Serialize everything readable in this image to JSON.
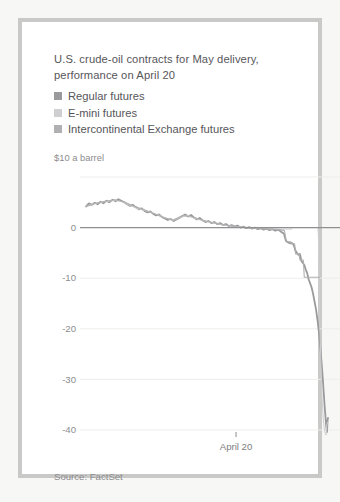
{
  "title": {
    "line1": "U.S. crude-oil contracts for May delivery,",
    "line2": "performance on April 20",
    "full": "U.S. crude-oil contracts for May delivery, performance on April 20"
  },
  "source": "Source: FactSet",
  "colors": {
    "series_regular": "#9a9a9c",
    "series_emini": "#cfcfd1",
    "series_ice": "#b0b0b2",
    "zero_line": "#8f8f91",
    "gridline": "#ededec",
    "text": "#56565a",
    "muted_text": "#8c8c8e",
    "frame": "#c9c9c7",
    "background": "#ffffff"
  },
  "chart_data": {
    "type": "line",
    "title": "U.S. crude-oil contracts for May delivery, performance on April 20",
    "subtitle": "",
    "xlabel": "",
    "ylabel": "$10 a barrel",
    "ylim": [
      -42,
      10
    ],
    "yticks": [
      10,
      0,
      -10,
      -20,
      -30,
      -40
    ],
    "ytick_labels": [
      "$10 a barrel",
      "0",
      "-10",
      "-20",
      "-30",
      "-40"
    ],
    "xticks": [
      0.62
    ],
    "xtick_labels": [
      "April 20"
    ],
    "xlim": [
      0,
      1
    ],
    "grid": true,
    "legend_position": "top-left",
    "annotations": [],
    "series": [
      {
        "name": "Regular futures",
        "color": "#9a9a9c",
        "width": 1.8,
        "points": [
          [
            0.0,
            4.2
          ],
          [
            0.012,
            4.8
          ],
          [
            0.024,
            4.5
          ],
          [
            0.036,
            4.9
          ],
          [
            0.048,
            4.6
          ],
          [
            0.06,
            5.1
          ],
          [
            0.072,
            4.8
          ],
          [
            0.084,
            5.3
          ],
          [
            0.096,
            5.0
          ],
          [
            0.11,
            5.5
          ],
          [
            0.122,
            5.2
          ],
          [
            0.134,
            5.6
          ],
          [
            0.146,
            5.3
          ],
          [
            0.158,
            5.0
          ],
          [
            0.17,
            4.6
          ],
          [
            0.182,
            4.3
          ],
          [
            0.194,
            4.5
          ],
          [
            0.206,
            4.0
          ],
          [
            0.218,
            3.6
          ],
          [
            0.23,
            3.8
          ],
          [
            0.242,
            3.3
          ],
          [
            0.254,
            3.0
          ],
          [
            0.266,
            3.2
          ],
          [
            0.278,
            2.7
          ],
          [
            0.29,
            2.4
          ],
          [
            0.302,
            2.6
          ],
          [
            0.314,
            2.1
          ],
          [
            0.326,
            1.8
          ],
          [
            0.338,
            1.5
          ],
          [
            0.35,
            1.7
          ],
          [
            0.362,
            1.3
          ],
          [
            0.374,
            1.6
          ],
          [
            0.386,
            1.9
          ],
          [
            0.398,
            2.3
          ],
          [
            0.41,
            2.6
          ],
          [
            0.422,
            2.2
          ],
          [
            0.434,
            2.5
          ],
          [
            0.446,
            2.0
          ],
          [
            0.458,
            1.6
          ],
          [
            0.47,
            1.9
          ],
          [
            0.482,
            1.4
          ],
          [
            0.494,
            1.1
          ],
          [
            0.506,
            1.3
          ],
          [
            0.518,
            0.9
          ],
          [
            0.53,
            1.1
          ],
          [
            0.542,
            0.7
          ],
          [
            0.554,
            0.9
          ],
          [
            0.566,
            0.5
          ],
          [
            0.578,
            0.7
          ],
          [
            0.59,
            0.3
          ],
          [
            0.602,
            0.5
          ],
          [
            0.614,
            0.2
          ],
          [
            0.626,
            0.4
          ],
          [
            0.638,
            0.0
          ],
          [
            0.65,
            0.2
          ],
          [
            0.662,
            -0.1
          ],
          [
            0.674,
            0.1
          ],
          [
            0.686,
            -0.2
          ],
          [
            0.698,
            0.0
          ],
          [
            0.71,
            -0.3
          ],
          [
            0.722,
            -0.1
          ],
          [
            0.734,
            -0.4
          ],
          [
            0.746,
            -0.2
          ],
          [
            0.758,
            -0.5
          ],
          [
            0.77,
            -0.3
          ],
          [
            0.782,
            -0.6
          ],
          [
            0.794,
            -0.4
          ],
          [
            0.806,
            -0.8
          ],
          [
            0.818,
            -1.2
          ],
          [
            0.826,
            -2.6
          ],
          [
            0.834,
            -2.9
          ],
          [
            0.842,
            -3.1
          ],
          [
            0.85,
            -3.0
          ],
          [
            0.858,
            -3.4
          ],
          [
            0.866,
            -4.6
          ],
          [
            0.872,
            -5.0
          ],
          [
            0.878,
            -5.4
          ],
          [
            0.884,
            -5.2
          ],
          [
            0.89,
            -6.6
          ],
          [
            0.896,
            -7.0
          ],
          [
            0.902,
            -7.4
          ],
          [
            0.908,
            -8.3
          ],
          [
            0.914,
            -9.0
          ],
          [
            0.92,
            -10.2
          ],
          [
            0.926,
            -11.0
          ],
          [
            0.932,
            -11.8
          ],
          [
            0.938,
            -13.0
          ],
          [
            0.944,
            -14.5
          ],
          [
            0.95,
            -16.0
          ],
          [
            0.954,
            -17.4
          ],
          [
            0.958,
            -18.8
          ],
          [
            0.962,
            -20.5
          ],
          [
            0.966,
            -22.4
          ],
          [
            0.97,
            -24.6
          ],
          [
            0.974,
            -27.0
          ],
          [
            0.978,
            -29.6
          ],
          [
            0.982,
            -32.4
          ],
          [
            0.986,
            -35.2
          ],
          [
            0.99,
            -37.6
          ],
          [
            0.993,
            -39.4
          ],
          [
            0.996,
            -40.4
          ],
          [
            0.998,
            -38.2
          ],
          [
            1.0,
            -37.6
          ]
        ]
      },
      {
        "name": "E-mini futures",
        "color": "#cfcfd1",
        "width": 1.0,
        "points": [
          [
            0.0,
            4.2
          ],
          [
            0.03,
            4.7
          ],
          [
            0.06,
            5.0
          ],
          [
            0.09,
            5.2
          ],
          [
            0.12,
            5.4
          ],
          [
            0.15,
            5.1
          ],
          [
            0.18,
            4.4
          ],
          [
            0.21,
            3.8
          ],
          [
            0.24,
            3.4
          ],
          [
            0.27,
            3.0
          ],
          [
            0.3,
            2.5
          ],
          [
            0.33,
            1.9
          ],
          [
            0.36,
            1.4
          ],
          [
            0.39,
            2.0
          ],
          [
            0.42,
            2.4
          ],
          [
            0.45,
            1.8
          ],
          [
            0.48,
            1.4
          ],
          [
            0.51,
            1.1
          ],
          [
            0.54,
            0.8
          ],
          [
            0.57,
            0.5
          ],
          [
            0.6,
            0.3
          ],
          [
            0.63,
            0.2
          ],
          [
            0.66,
            0.0
          ],
          [
            0.69,
            -0.1
          ],
          [
            0.72,
            -0.2
          ],
          [
            0.75,
            -0.2
          ],
          [
            0.78,
            -0.3
          ],
          [
            0.81,
            -0.3
          ],
          [
            0.83,
            -0.3
          ],
          [
            0.85,
            -0.3
          ],
          [
            0.852,
            0.0
          ],
          [
            0.9,
            0.0
          ],
          [
            0.93,
            0.0
          ],
          [
            0.955,
            0.0
          ],
          [
            0.958,
            0.0
          ],
          [
            0.96,
            -1.0
          ],
          [
            0.962,
            -6.0
          ],
          [
            0.964,
            -14.0
          ],
          [
            0.968,
            -22.0
          ],
          [
            0.972,
            -29.0
          ],
          [
            0.976,
            -34.0
          ],
          [
            0.98,
            -37.5
          ],
          [
            0.984,
            -39.5
          ],
          [
            0.988,
            -40.6
          ],
          [
            0.992,
            -41.0
          ],
          [
            0.995,
            -39.0
          ],
          [
            1.0,
            -38.4
          ]
        ]
      },
      {
        "name": "Intercontinental Exchange futures",
        "color": "#b0b0b2",
        "width": 1.1,
        "points": [
          [
            0.0,
            4.1
          ],
          [
            0.04,
            4.8
          ],
          [
            0.08,
            5.2
          ],
          [
            0.12,
            5.5
          ],
          [
            0.16,
            5.0
          ],
          [
            0.2,
            4.2
          ],
          [
            0.24,
            3.5
          ],
          [
            0.28,
            2.8
          ],
          [
            0.32,
            2.0
          ],
          [
            0.36,
            1.5
          ],
          [
            0.4,
            2.4
          ],
          [
            0.44,
            2.1
          ],
          [
            0.48,
            1.5
          ],
          [
            0.52,
            1.0
          ],
          [
            0.56,
            0.6
          ],
          [
            0.6,
            0.3
          ],
          [
            0.64,
            0.1
          ],
          [
            0.68,
            -0.1
          ],
          [
            0.72,
            -0.2
          ],
          [
            0.76,
            -0.3
          ],
          [
            0.8,
            -0.4
          ],
          [
            0.82,
            -0.6
          ],
          [
            0.828,
            -2.8
          ],
          [
            0.845,
            -2.8
          ],
          [
            0.848,
            -3.2
          ],
          [
            0.862,
            -3.2
          ],
          [
            0.866,
            -5.2
          ],
          [
            0.88,
            -5.2
          ],
          [
            0.884,
            -6.4
          ],
          [
            0.898,
            -6.4
          ],
          [
            0.902,
            -9.8
          ],
          [
            0.96,
            -9.8
          ],
          [
            0.962,
            -9.9
          ],
          [
            0.966,
            -9.9
          ]
        ]
      }
    ]
  },
  "legend": {
    "items": [
      {
        "label": "Regular futures",
        "color": "#9a9a9c"
      },
      {
        "label": "E-mini futures",
        "color": "#cfcfd1"
      },
      {
        "label": "Intercontinental Exchange futures",
        "color": "#b0b0b2"
      }
    ]
  },
  "axes": {
    "y_top_label": "$10 a barrel",
    "y_labels": [
      "0",
      "-10",
      "-20",
      "-30",
      "-40"
    ],
    "x_label": "April 20"
  }
}
